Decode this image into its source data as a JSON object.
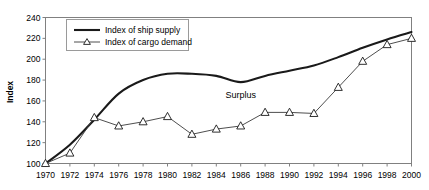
{
  "chart_data": {
    "type": "line",
    "title": "",
    "xlabel": "",
    "ylabel": "Index",
    "xlim": [
      1970,
      2000
    ],
    "ylim": [
      100,
      240
    ],
    "grid": false,
    "legend_position": "top-left",
    "x": [
      1970,
      1972,
      1974,
      1976,
      1978,
      1980,
      1982,
      1984,
      1986,
      1988,
      1990,
      1992,
      1994,
      1996,
      1998,
      2000
    ],
    "xticklabels": [
      "1970",
      "1972",
      "1974",
      "1976",
      "1978",
      "1980",
      "1982",
      "1984",
      "1986",
      "1988",
      "1990",
      "1992",
      "1994",
      "1996",
      "1998",
      "2000"
    ],
    "yticks": [
      100,
      120,
      140,
      160,
      180,
      200,
      220,
      240
    ],
    "yticklabels": [
      "100",
      "120",
      "140",
      "160",
      "180",
      "200",
      "220",
      "240"
    ],
    "series": [
      {
        "name": "Index of ship supply",
        "marker": "none",
        "values": [
          100,
          118,
          142,
          167,
          180,
          186,
          186,
          184,
          178,
          184,
          189,
          194,
          202,
          211,
          219,
          226
        ]
      },
      {
        "name": "Index of cargo demand",
        "marker": "triangle",
        "values": [
          100,
          110,
          144,
          136,
          140,
          145,
          128,
          133,
          136,
          149,
          149,
          148,
          173,
          198,
          214,
          220
        ]
      }
    ],
    "annotations": [
      {
        "text": "Surplus",
        "x": 1986,
        "y": 163
      }
    ]
  },
  "axes": {
    "y_title": "Index"
  },
  "legend": {
    "items": [
      {
        "label": "Index of ship supply"
      },
      {
        "label": "Index of cargo demand"
      }
    ]
  }
}
